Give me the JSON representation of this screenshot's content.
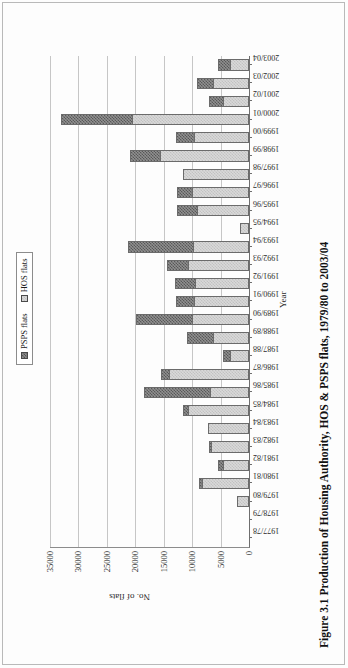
{
  "figure": {
    "caption": "Figure 3.1 Production of Housing Authority, HOS & PSPS flats, 1979/80 to 2003/04"
  },
  "legend": {
    "items": [
      {
        "label": "PSPS flats",
        "swatch": "psps-dark-checkered",
        "color": "#707070"
      },
      {
        "label": "HOS flats",
        "swatch": "hos-light-checkered",
        "color": "#d4d4d4"
      }
    ]
  },
  "axes": {
    "value_title": "No. of flats",
    "category_title": "Year",
    "value_ticks": [
      "0",
      "5000",
      "10000",
      "15000",
      "20000",
      "25000",
      "30000",
      "35000"
    ]
  },
  "chart_data": {
    "type": "bar",
    "orientation": "horizontal-stacked",
    "title": "Figure 3.1 Production of Housing Authority, HOS & PSPS flats, 1979/80 to 2003/04",
    "xlabel": "Year",
    "ylabel": "No. of flats",
    "ylim": [
      0,
      35000
    ],
    "grid": true,
    "legend_position": "top-left",
    "categories": [
      "1977/78",
      "1978/79",
      "1979/80",
      "1980/81",
      "1981/82",
      "1982/83",
      "1983/84",
      "1984/85",
      "1985/86",
      "1986/87",
      "1987/88",
      "1988/89",
      "1989/90",
      "1990/91",
      "1991/92",
      "1992/93",
      "1993/94",
      "1994/95",
      "1995/96",
      "1996/97",
      "1997/98",
      "1998/99",
      "1999/00",
      "2000/01",
      "2001/02",
      "2002/03",
      "2003/04"
    ],
    "series": [
      {
        "name": "HOS flats",
        "color": "#d4d4d4",
        "values": [
          0,
          0,
          2100,
          8300,
          4500,
          6700,
          7300,
          10700,
          6900,
          14100,
          3300,
          6400,
          10100,
          9700,
          9500,
          10800,
          9900,
          1600,
          9200,
          10000,
          11600,
          15700,
          9700,
          20500,
          4500,
          6300,
          3400
        ]
      },
      {
        "name": "PSPS flats",
        "color": "#707070",
        "values": [
          0,
          0,
          0,
          500,
          900,
          300,
          0,
          900,
          11500,
          1300,
          1200,
          4500,
          9800,
          3200,
          3600,
          3600,
          11400,
          0,
          3500,
          2700,
          0,
          5200,
          3100,
          12500,
          2600,
          2900,
          2000
        ]
      }
    ]
  }
}
